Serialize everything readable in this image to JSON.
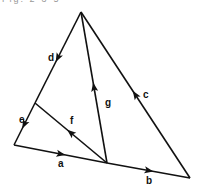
{
  "caption": "Fig. 2-3-5",
  "vertices": {
    "apex": [
      81,
      12
    ],
    "mid_left": [
      35,
      103
    ],
    "bottom_left": [
      14,
      145
    ],
    "junction": [
      107,
      163
    ],
    "bottom_right": [
      190,
      178
    ]
  },
  "edges": [
    {
      "label": "a",
      "from": "bottom_left",
      "to": "junction",
      "label_pos": [
        58,
        167
      ]
    },
    {
      "label": "b",
      "from": "junction",
      "to": "bottom_right",
      "label_pos": [
        146,
        184
      ]
    },
    {
      "label": "c",
      "from": "bottom_right",
      "to": "apex",
      "label_pos": [
        143,
        98
      ]
    },
    {
      "label": "d",
      "from": "apex",
      "to": "mid_left",
      "label_pos": [
        48,
        61
      ]
    },
    {
      "label": "e",
      "from": "mid_left",
      "to": "bottom_left",
      "label_pos": [
        19,
        123
      ]
    },
    {
      "label": "f",
      "from": "junction",
      "to": "mid_left",
      "label_pos": [
        70,
        124
      ]
    },
    {
      "label": "g",
      "from": "junction",
      "to": "apex",
      "label_pos": [
        105,
        106
      ]
    }
  ]
}
